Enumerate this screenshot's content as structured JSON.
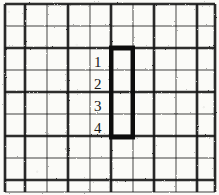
{
  "figure": {
    "background_color": "#fbfbf8",
    "ink_color": "#161616",
    "grid": {
      "columns": 10,
      "rows": 9,
      "x_lines": [
        5,
        25,
        47,
        68,
        90,
        111,
        133,
        154,
        176,
        197,
        215
      ],
      "y_lines": [
        4,
        26,
        48,
        70,
        92,
        114,
        136,
        158,
        180,
        192
      ],
      "heavy_line_width": 2.6,
      "light_line_width": 1.3,
      "line_style": "hand-drawn-scanned"
    },
    "highlighted_region": {
      "label": "bold-rectangle",
      "stroke_color": "#111111",
      "stroke_width": 5,
      "x": 111,
      "y": 48,
      "width": 22,
      "height": 89,
      "cells_wide": 1,
      "cells_tall": 4
    },
    "cell_labels": [
      {
        "text": "1",
        "x": 94,
        "y": 55
      },
      {
        "text": "2",
        "x": 94,
        "y": 77
      },
      {
        "text": "3",
        "x": 94,
        "y": 99
      },
      {
        "text": "4",
        "x": 94,
        "y": 121
      }
    ]
  }
}
